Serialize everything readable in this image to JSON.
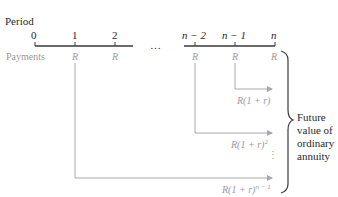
{
  "diagram": {
    "title": "Period",
    "row_label": "Payments",
    "periods": [
      "0",
      "1",
      "2",
      "…",
      "n − 2",
      "n − 1",
      "n"
    ],
    "payment_symbol": "R",
    "payments": [
      "R",
      "R",
      "R",
      "R",
      "R"
    ],
    "future_values": [
      {
        "base": "R(1 + r)",
        "exp": ""
      },
      {
        "base": "R(1 + r)",
        "exp": "2"
      },
      {
        "base": "R(1 + r)",
        "exp": "n − 1"
      }
    ],
    "vertical_ellipsis": "⋮",
    "brace_label": [
      "Future",
      "value of",
      "ordinary",
      "annuity"
    ],
    "colors": {
      "axis": "#3a3a3a",
      "arrows": "#a8a8a8",
      "payments_text": "#9a9a9a",
      "text": "#2a2a2a"
    }
  }
}
